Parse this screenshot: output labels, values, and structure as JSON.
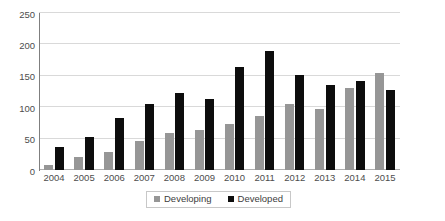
{
  "chart_data": {
    "type": "bar",
    "title": "",
    "subtitle": "",
    "xlabel": "",
    "ylabel": "",
    "ylim": [
      0,
      250
    ],
    "yticks": [
      0,
      50,
      100,
      150,
      200,
      250
    ],
    "grid": true,
    "legend_position": "bottom",
    "categories": [
      "2004",
      "2005",
      "2006",
      "2007",
      "2008",
      "2009",
      "2010",
      "2011",
      "2012",
      "2013",
      "2014",
      "2015"
    ],
    "series": [
      {
        "name": "Developing",
        "color": "#969696",
        "values": [
          8,
          20,
          29,
          46,
          59,
          63,
          74,
          86,
          105,
          97,
          130,
          155
        ]
      },
      {
        "name": "Developed",
        "color": "#0d0d0d",
        "values": [
          37,
          53,
          83,
          105,
          122,
          113,
          164,
          190,
          151,
          135,
          141,
          128
        ]
      }
    ]
  },
  "legend": {
    "items": [
      {
        "label": "Developing",
        "swatch": "square-swatch-gray"
      },
      {
        "label": "Developed",
        "swatch": "square-swatch-black"
      }
    ]
  },
  "axis": {
    "y_tick_labels": [
      "250",
      "200",
      "150",
      "100",
      "50",
      "0"
    ],
    "x_tick_labels": [
      "2004",
      "2005",
      "2006",
      "2007",
      "2008",
      "2009",
      "2010",
      "2011",
      "2012",
      "2013",
      "2014",
      "2015"
    ]
  }
}
